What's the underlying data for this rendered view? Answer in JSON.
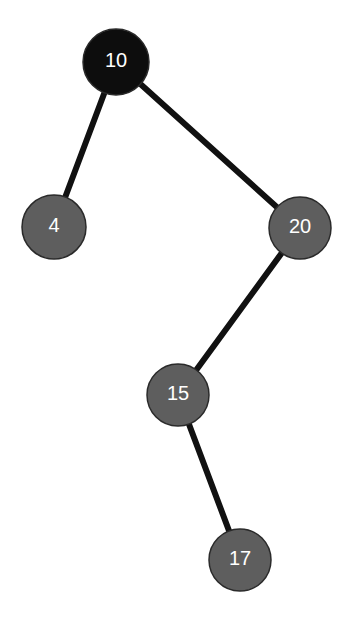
{
  "diagram": {
    "type": "binary-search-tree",
    "colors": {
      "root_fill": "#0d0d0d",
      "node_fill": "#5e5e5e",
      "node_stroke": "#2a2a2a",
      "edge": "#111111",
      "label": "#ffffff",
      "background": "#ffffff"
    },
    "nodes": [
      {
        "id": "n10",
        "label": "10",
        "x": 116,
        "y": 62,
        "r": 33,
        "root": true
      },
      {
        "id": "n4",
        "label": "4",
        "x": 54,
        "y": 227,
        "r": 32,
        "root": false
      },
      {
        "id": "n20",
        "label": "20",
        "x": 300,
        "y": 228,
        "r": 31,
        "root": false
      },
      {
        "id": "n15",
        "label": "15",
        "x": 178,
        "y": 395,
        "r": 31,
        "root": false
      },
      {
        "id": "n17",
        "label": "17",
        "x": 240,
        "y": 560,
        "r": 31,
        "root": false
      }
    ],
    "edges": [
      {
        "from": "n10",
        "to": "n4"
      },
      {
        "from": "n10",
        "to": "n20"
      },
      {
        "from": "n20",
        "to": "n15"
      },
      {
        "from": "n15",
        "to": "n17"
      }
    ]
  }
}
